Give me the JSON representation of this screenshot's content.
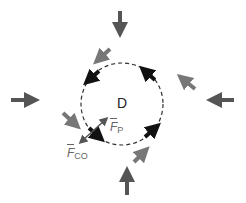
{
  "diagram": {
    "region_label": "D",
    "force_p": {
      "symbol": "F",
      "subscript": "P"
    },
    "force_co": {
      "symbol": "F",
      "subscript": "CO"
    },
    "boundary": {
      "shape": "dashed-circle",
      "cx": 122,
      "cy": 104,
      "r": 41
    },
    "colors": {
      "outer_arrow": "#555555",
      "diag_arrow": "#777777",
      "inner_arrow": "#111111",
      "boundary": "#333333",
      "label": "#666666"
    }
  }
}
